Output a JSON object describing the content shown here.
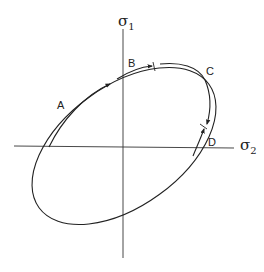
{
  "diagram": {
    "type": "stress-space yield ellipse with loading path",
    "colors": {
      "line": "#222222",
      "background": "#ffffff"
    },
    "axes": {
      "horizontal": {
        "symbol": "σ",
        "subscript": "2"
      },
      "vertical": {
        "symbol": "σ",
        "subscript": "1"
      }
    },
    "points": [
      {
        "id": "A",
        "label": "A"
      },
      {
        "id": "B",
        "label": "B"
      },
      {
        "id": "C",
        "label": "C"
      },
      {
        "id": "D",
        "label": "D"
      }
    ]
  }
}
